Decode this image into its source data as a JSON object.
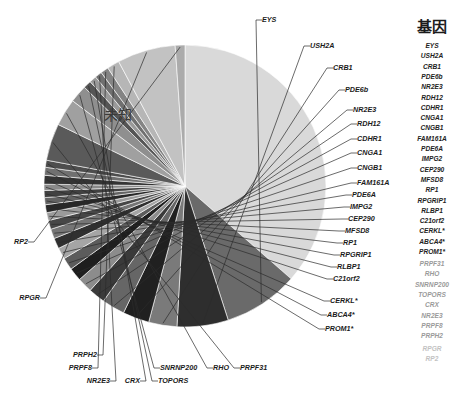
{
  "figure": {
    "center_label": "未知",
    "legend_title": "基因",
    "caption": ""
  },
  "chart_data": {
    "type": "pie",
    "title": "",
    "legend_title": "基因",
    "legend_position": "right",
    "grid": false,
    "center_slice_label": "未知",
    "units": "percent",
    "categories": [
      "未知",
      "EYS",
      "USH2A",
      "CRB1",
      "PDE6b",
      "NR2E3",
      "RDH12",
      "CDHR1",
      "CNGA1",
      "CNGB1",
      "FAM161A",
      "PDE6A",
      "IMPG2",
      "CEP290",
      "MFSD8",
      "RP1",
      "RPGRIP1",
      "RLBP1",
      "C21orf2",
      "CERKL*",
      "ABCA4*",
      "PROM1*",
      "PRPF31",
      "RHO",
      "SNRNP200",
      "TOPORS",
      "CRX",
      "NR2E3",
      "PRPF8",
      "PRPH2",
      "RPGR",
      "RP2"
    ],
    "values": [
      36.0,
      8.5,
      5.8,
      3.2,
      3.0,
      2.6,
      1.9,
      1.7,
      1.5,
      1.4,
      1.3,
      1.2,
      1.1,
      1.0,
      0.9,
      0.9,
      0.8,
      0.8,
      0.7,
      1.0,
      0.9,
      0.8,
      4.2,
      3.1,
      2.0,
      0.9,
      0.8,
      0.8,
      0.9,
      1.4,
      6.6,
      1.1
    ],
    "colors": [
      "#d9d9d9",
      "#6a6a6a",
      "#2e2e2e",
      "#7a7a7a",
      "#202020",
      "#666666",
      "#3a3a3a",
      "#8c8c8c",
      "#1e1e1e",
      "#5c5c5c",
      "#a5a5a5",
      "#303030",
      "#757575",
      "#474747",
      "#9b9b9b",
      "#282828",
      "#636363",
      "#414141",
      "#8a8a8a",
      "#343434",
      "#707070",
      "#4d4d4d",
      "#5a5a5a",
      "#a0a0a0",
      "#8f8f8f",
      "#555555",
      "#9a9a9a",
      "#707070",
      "#848484",
      "#b6b6b6",
      "#c2c2c2",
      "#ababab"
    ]
  },
  "callouts": {
    "right": [
      {
        "label": "EYS"
      },
      {
        "label": "USH2A"
      },
      {
        "label": "CRB1"
      },
      {
        "label": "PDE6b"
      },
      {
        "label": "NR2E3"
      },
      {
        "label": "RDH12"
      },
      {
        "label": "CDHR1"
      },
      {
        "label": "CNGA1"
      },
      {
        "label": "CNGB1"
      },
      {
        "label": "FAM161A"
      },
      {
        "label": "PDE6A"
      },
      {
        "label": "IMPG2"
      },
      {
        "label": "CEP290"
      },
      {
        "label": "MFSD8"
      },
      {
        "label": "RP1"
      },
      {
        "label": "RPGRIP1"
      },
      {
        "label": "RLBP1"
      },
      {
        "label": "C21orf2"
      },
      {
        "label": "CERKL*"
      },
      {
        "label": "ABCA4*"
      },
      {
        "label": "PROM1*"
      }
    ],
    "bottom": [
      {
        "label": "PRPH2"
      },
      {
        "label": "PRPF8"
      },
      {
        "label": "NR2E3"
      },
      {
        "label": "CRX"
      },
      {
        "label": "TOPORS"
      },
      {
        "label": "SNRNP200"
      },
      {
        "label": "RHO"
      },
      {
        "label": "PRPF31"
      }
    ],
    "left": [
      {
        "label": "RP2"
      },
      {
        "label": "RPGR"
      }
    ]
  },
  "legend": {
    "title": "基因",
    "items": [
      {
        "label": "EYS",
        "tone": "normal"
      },
      {
        "label": "USH2A",
        "tone": "normal"
      },
      {
        "label": "CRB1",
        "tone": "normal"
      },
      {
        "label": "PDE6b",
        "tone": "normal"
      },
      {
        "label": "NR2E3",
        "tone": "normal"
      },
      {
        "label": "RDH12",
        "tone": "normal"
      },
      {
        "label": "CDHR1",
        "tone": "normal"
      },
      {
        "label": "CNGA1",
        "tone": "normal"
      },
      {
        "label": "CNGB1",
        "tone": "normal"
      },
      {
        "label": "FAM161A",
        "tone": "normal"
      },
      {
        "label": "PDE6A",
        "tone": "normal"
      },
      {
        "label": "IMPG2",
        "tone": "normal"
      },
      {
        "label": "CEP290",
        "tone": "normal"
      },
      {
        "label": "MFSD8",
        "tone": "normal"
      },
      {
        "label": "RP1",
        "tone": "normal"
      },
      {
        "label": "RPGRIP1",
        "tone": "normal"
      },
      {
        "label": "RLBP1",
        "tone": "normal"
      },
      {
        "label": "C21orf2",
        "tone": "normal"
      },
      {
        "label": "CERKL*",
        "tone": "normal"
      },
      {
        "label": "ABCA4*",
        "tone": "normal"
      },
      {
        "label": "PROM1*",
        "tone": "normal"
      },
      {
        "label": "PRPF31",
        "tone": "dim"
      },
      {
        "label": "RHO",
        "tone": "dim"
      },
      {
        "label": "SNRNP200",
        "tone": "dim"
      },
      {
        "label": "TOPORS",
        "tone": "dim"
      },
      {
        "label": "CRX",
        "tone": "dim"
      },
      {
        "label": "NR2E3",
        "tone": "dim"
      },
      {
        "label": "PRPF8",
        "tone": "dim"
      },
      {
        "label": "PRPH2",
        "tone": "dim"
      },
      {
        "label": "RPGR",
        "tone": "dimmer"
      },
      {
        "label": "RP2",
        "tone": "dimmer"
      }
    ]
  }
}
